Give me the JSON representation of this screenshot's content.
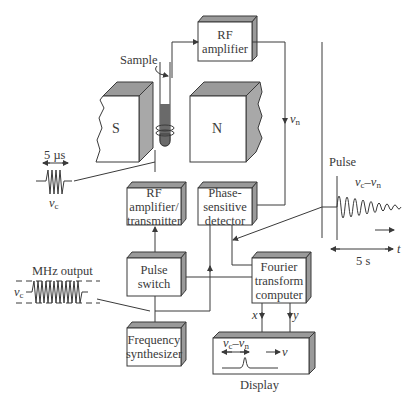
{
  "diagram": {
    "blocks": {
      "rf_amplifier": {
        "line1": "RF",
        "line2": "amplifier"
      },
      "rf_amp_transmitter": {
        "line1": "RF",
        "line2": "amplifier/",
        "line3": "transmitter"
      },
      "phase_detector": {
        "line1": "Phase-",
        "line2": "sensitive",
        "line3": "detector"
      },
      "pulse_switch": {
        "line1": "Pulse",
        "line2": "switch"
      },
      "frequency_synth": {
        "line1": "Frequency",
        "line2": "synthesizer"
      },
      "fourier_computer": {
        "line1": "Fourier",
        "line2": "transform",
        "line3": "computer"
      },
      "display": {
        "label": "Display"
      }
    },
    "magnets": {
      "south": "S",
      "north": "N"
    },
    "labels": {
      "sample": "Sample",
      "nu_n": "ν",
      "nu_n_sub": "n",
      "pulse": "Pulse",
      "pulse_width": "5 µs",
      "nu_c": "ν",
      "nu_c_sub": "c",
      "mhz_output": "MHz output",
      "fid_freq_a": "ν",
      "fid_freq_a_sub": "c",
      "fid_freq_dash": "–ν",
      "fid_freq_b_sub": "n",
      "time_scale": "5 s",
      "t_axis": "t",
      "x_out": "x",
      "y_out": "y",
      "display_freq_a": "ν",
      "display_freq_a_sub": "c",
      "display_freq_dash": "–ν",
      "display_freq_b_sub": "n",
      "display_axis": "ν"
    },
    "colors": {
      "line": "#3a3a3a",
      "box_shade": "#9a9a9a",
      "magnet_side": "#a8a8a8",
      "sample_fill": "#6a6a6a"
    }
  }
}
